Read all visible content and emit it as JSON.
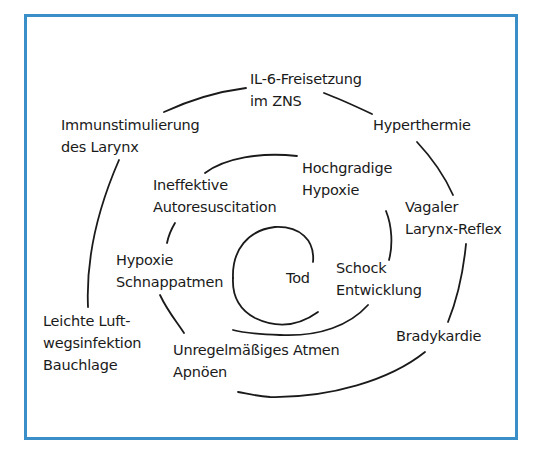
{
  "diagram": {
    "type": "spiral",
    "frame_color": "#3a8fc9",
    "line_color": "#1a1a1a",
    "center_label": "Tod",
    "nodes": [
      {
        "id": "il6",
        "lines": [
          "IL-6-Freisetzung",
          "im ZNS"
        ]
      },
      {
        "id": "hyperthermie",
        "lines": [
          "Hyperthermie"
        ]
      },
      {
        "id": "vagaler",
        "lines": [
          "Vagaler",
          "Larynx-Reflex"
        ]
      },
      {
        "id": "bradykardie",
        "lines": [
          "Bradykardie"
        ]
      },
      {
        "id": "unregelmaessig",
        "lines": [
          "Unregelmäßiges Atmen",
          "Apnöen"
        ]
      },
      {
        "id": "leichte",
        "lines": [
          "Leichte Luft-",
          "wegsinfektion",
          "Bauchlage"
        ]
      },
      {
        "id": "immunstimulierung",
        "lines": [
          "Immunstimulierung",
          "des Larynx"
        ]
      },
      {
        "id": "ineffektive",
        "lines": [
          "Ineffektive",
          "Autoresuscitation"
        ]
      },
      {
        "id": "hochgradige",
        "lines": [
          "Hochgradige",
          "Hypoxie"
        ]
      },
      {
        "id": "schock",
        "lines": [
          "Schock",
          "Entwicklung"
        ]
      },
      {
        "id": "hypoxie",
        "lines": [
          "Hypoxie",
          "Schnappatmen"
        ]
      },
      {
        "id": "tod",
        "lines": [
          "Tod"
        ]
      }
    ]
  }
}
